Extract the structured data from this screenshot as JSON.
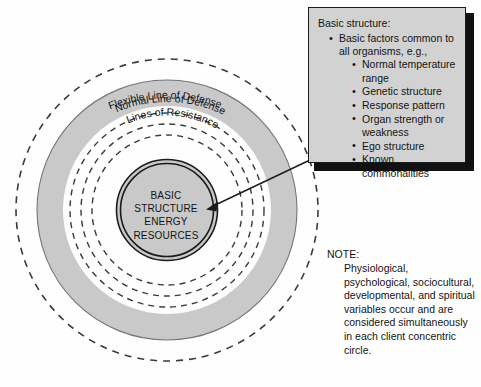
{
  "figure": {
    "background_color": "#fefefe"
  },
  "colors": {
    "ring_fill_gray": "#c9c9c9",
    "ring_stroke": "#6e6e6e",
    "dashed_stroke": "#3a3a3a",
    "core_stroke": "#1b1b1b",
    "callout_fill": "#d2d2d2",
    "callout_border": "#1b1b1b",
    "callout_shadow": "#111111",
    "text": "#141414"
  },
  "rings": [
    {
      "id": "flexible-line-of-defense",
      "label": "Flexible Line of Defense",
      "style": "dashed",
      "radius": 151
    },
    {
      "id": "normal-line-of-defense",
      "label": "Normal Line of Defense",
      "style": "solid-filled",
      "radius": 130
    },
    {
      "id": "lines-of-resistance",
      "label": "Lines of Resistance",
      "style": "dashed",
      "radii": [
        97,
        86,
        75
      ]
    },
    {
      "id": "basic-structure-core",
      "label": "",
      "style": "solid-double",
      "radius": 50
    }
  ],
  "core": {
    "lines": [
      "BASIC",
      "STRUCTURE",
      "ENERGY",
      "RESOURCES"
    ]
  },
  "callout": {
    "title": "Basic structure:",
    "items": [
      {
        "text": "Basic factors common to all organisms, e.g.,",
        "children": [
          "Normal temperature range",
          "Genetic structure",
          "Response pattern",
          "Organ strength or weakness",
          "Ego structure",
          "Known commonalities"
        ]
      }
    ]
  },
  "note": {
    "label": "NOTE:",
    "body": "Physiological, psychological, sociocultural, developmental, and spiritual variables occur and are considered simultaneously in each client concentric circle."
  }
}
